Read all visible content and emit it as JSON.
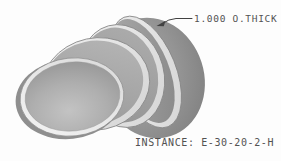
{
  "drawing": {
    "description": "Shaded isometric render of four stacked cylindrical disc segments (gored stack) viewed from front-left",
    "disc_count": 4
  },
  "callout": {
    "label": "1.000 O.THICK",
    "target": "rim of rear disc segment",
    "leader_icon": "arrowhead"
  },
  "instance_note": {
    "text": "INSTANCE: E-30-20-2-H",
    "label": "INSTANCE:",
    "value": "E-30-20-2-H"
  },
  "colors": {
    "background": "#fdfdfd",
    "annotation_text": "#525252",
    "leader_line": "#414141",
    "rim_highlight": "#f1f1f1",
    "face_gray_light": "#c3c3c3",
    "face_gray_mid": "#a6a6a6",
    "face_gray_dark": "#8a8a8a",
    "back_mass_dark": "#7c7c7c",
    "seam_line": "#858585"
  }
}
